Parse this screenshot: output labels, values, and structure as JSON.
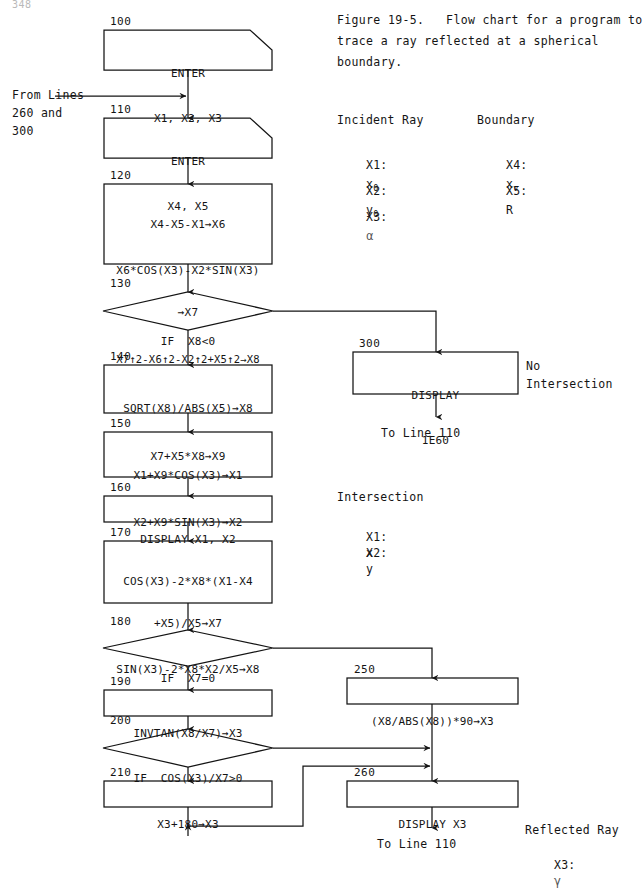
{
  "page": {
    "number": "348",
    "background": "#ffffff",
    "ink": "#141414"
  },
  "caption": {
    "line1": "Figure 19-5.   Flow chart for a program to",
    "line2": "trace a ray reflected at a spherical",
    "line3": "boundary."
  },
  "legend": {
    "incident": {
      "title": "Incident Ray",
      "rows": [
        {
          "var": "X1:",
          "sym": "x",
          "sub": "0"
        },
        {
          "var": "X2:",
          "sym": "y",
          "sub": "0"
        },
        {
          "var": "X3:",
          "sym": "α",
          "sub": ""
        }
      ]
    },
    "boundary": {
      "title": "Boundary",
      "rows": [
        {
          "var": "X4:",
          "sym": "x",
          "sub": "v"
        },
        {
          "var": "X5:",
          "sym": "R",
          "sub": ""
        }
      ]
    },
    "intersection": {
      "title": "Intersection",
      "rows": [
        {
          "var": "X1:",
          "sym": "x",
          "sub": ""
        },
        {
          "var": "X2:",
          "sym": "y",
          "sub": ""
        }
      ]
    },
    "reflected": {
      "title": "Reflected Ray",
      "rows": [
        {
          "var": "X3:",
          "sym": "γ",
          "sub": ""
        }
      ]
    }
  },
  "entry_label": {
    "line1": "From Lines",
    "line2": "260 and",
    "line3": "300"
  },
  "exit_labels": {
    "to_line_110_a": "To Line 110",
    "to_line_110_b": "To Line 110",
    "no_intersection_1": "No",
    "no_intersection_2": "Intersection"
  },
  "nodes": [
    {
      "id": "n100",
      "linenum": "100",
      "shape": "io",
      "lines": [
        "ENTER",
        "X1, X2, X3"
      ]
    },
    {
      "id": "n110",
      "linenum": "110",
      "shape": "io",
      "lines": [
        "ENTER",
        "X4, X5"
      ]
    },
    {
      "id": "n120",
      "linenum": "120",
      "shape": "process",
      "lines": [
        "X4-X5-X1→X6",
        "X6*COS(X3)-X2*SIN(X3)",
        "→X7",
        "X7↑2-X6↑2-X2↑2+X5↑2→X8"
      ]
    },
    {
      "id": "n130",
      "linenum": "130",
      "shape": "decision",
      "lines": [
        "IF  X8<0"
      ]
    },
    {
      "id": "n300",
      "linenum": "300",
      "shape": "process",
      "lines": [
        "DISPLAY",
        "1E60"
      ]
    },
    {
      "id": "n140",
      "linenum": "140",
      "shape": "process",
      "lines": [
        "SQRT(X8)/ABS(X5)→X8",
        "X7+X5*X8→X9"
      ]
    },
    {
      "id": "n150",
      "linenum": "150",
      "shape": "process",
      "lines": [
        "X1+X9*COS(X3)→X1",
        "X2+X9*SIN(X3)→X2"
      ]
    },
    {
      "id": "n160",
      "linenum": "160",
      "shape": "process",
      "lines": [
        "DISPLAY X1, X2"
      ]
    },
    {
      "id": "n170",
      "linenum": "170",
      "shape": "process",
      "lines": [
        "COS(X3)-2*X8*(X1-X4",
        "+X5)/X5→X7",
        "SIN(X3)-2*X8*X2/X5→X8"
      ]
    },
    {
      "id": "n180",
      "linenum": "180",
      "shape": "decision",
      "lines": [
        "IF  X7=0"
      ]
    },
    {
      "id": "n250",
      "linenum": "250",
      "shape": "process",
      "lines": [
        "(X8/ABS(X8))*90→X3"
      ]
    },
    {
      "id": "n190",
      "linenum": "190",
      "shape": "process",
      "lines": [
        "INVTAN(X8/X7)→X3"
      ]
    },
    {
      "id": "n200",
      "linenum": "200",
      "shape": "decision",
      "lines": [
        "IF  COS(X3)/X7>0"
      ]
    },
    {
      "id": "n210",
      "linenum": "210",
      "shape": "process",
      "lines": [
        "X3+180→X3"
      ]
    },
    {
      "id": "n260",
      "linenum": "260",
      "shape": "process",
      "lines": [
        "DISPLAY X3"
      ]
    }
  ]
}
